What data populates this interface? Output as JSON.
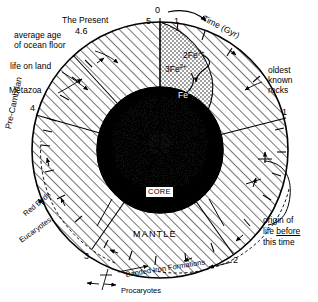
{
  "figure": {
    "type": "radial-time-diagram",
    "title_axis": "Time (Gyr)",
    "outer_label_zero": "0",
    "tick_five": "5",
    "tick_one_top": "1"
  },
  "axis": {
    "label": "Time (Gyr)",
    "unit": "Gyr",
    "direction": "clockwise",
    "ticks": [
      "0",
      "1",
      "2",
      "3",
      "4",
      "5"
    ]
  },
  "ticks": {
    "zero": "0",
    "one": "1",
    "two": "2",
    "three": "3",
    "four": "4",
    "five": "5",
    "present": "4.6"
  },
  "annotations": {
    "present": "The Present",
    "present_value": "4.6",
    "ocean_floor_l1": "average age",
    "ocean_floor_l2": "of ocean floor",
    "life_on_land": "life on land",
    "metazoa": "Metazoa",
    "precambrian": "Pre-Cambrian",
    "red_beds": "Red Beds",
    "eucaryotes": "Eucaryotes",
    "banded_iron": "Banded Iron Formations",
    "procaryotes": "Procaryotes",
    "oldest_l1": "oldest",
    "oldest_l2": "known",
    "oldest_l3": "rocks",
    "origin_l1": "origin of",
    "origin_l2a": "life ",
    "origin_l2b": "before",
    "origin_l3": "this time"
  },
  "interior": {
    "core": "CORE",
    "mantle": "MANTLE",
    "iron_ferric_coef": "2Fe",
    "iron_ferric_charge": "3+",
    "iron_ferrous_coef": "3Fe",
    "iron_ferrous_charge": "2+",
    "iron_metal_sym": "Fe",
    "iron_metal_charge": "o"
  },
  "colors": {
    "ink": "#000000",
    "paper": "#ffffff",
    "hatch": "#1a1a1a",
    "core": "#0d0d0d",
    "stipple": "#2b2b2b"
  }
}
